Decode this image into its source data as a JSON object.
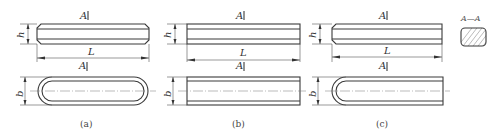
{
  "figure": {
    "views": [
      {
        "id": "a",
        "caption": "(a)",
        "section_label_top": "A",
        "section_label_bottom": "A",
        "height_dim": "h",
        "length_dim": "L",
        "width_dim": "b",
        "end_type": "round-both-ends"
      },
      {
        "id": "b",
        "caption": "(b)",
        "section_label_top": "A",
        "section_label_bottom": "A",
        "height_dim": "h",
        "length_dim": "L",
        "width_dim": "b",
        "end_type": "square-both-ends"
      },
      {
        "id": "c",
        "caption": "(c)",
        "section_label_top": "A",
        "section_label_bottom": "A",
        "height_dim": "h",
        "length_dim": "L",
        "width_dim": "b",
        "end_type": "round-one-end"
      }
    ],
    "section_view": {
      "label": "A—A",
      "fill": "hatched"
    },
    "colors": {
      "line": "#3a3a3a",
      "background": "#ffffff"
    }
  }
}
